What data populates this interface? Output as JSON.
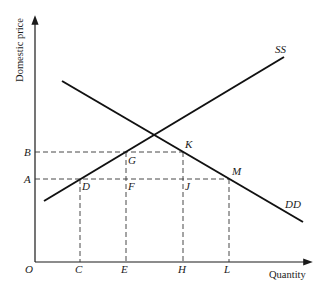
{
  "diagram": {
    "title": "",
    "y_axis_label": "Domestic price",
    "x_axis_label": "Quantity",
    "origin_label": "O",
    "curves": [
      {
        "name": "SS",
        "label": "SS",
        "type": "supply"
      },
      {
        "name": "DD",
        "label": "DD",
        "type": "demand"
      }
    ],
    "price_levels": [
      {
        "label": "B"
      },
      {
        "label": "A"
      }
    ],
    "quantity_marks": [
      {
        "label": "C"
      },
      {
        "label": "E"
      },
      {
        "label": "H"
      },
      {
        "label": "L"
      }
    ],
    "points": [
      {
        "label": "G"
      },
      {
        "label": "K"
      },
      {
        "label": "D"
      },
      {
        "label": "F"
      },
      {
        "label": "J"
      },
      {
        "label": "M"
      }
    ]
  }
}
